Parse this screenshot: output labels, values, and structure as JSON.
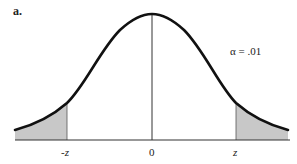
{
  "panel_label": "a.",
  "annotation": "α = .01",
  "x_axis": {
    "ticks": [
      {
        "label": "-z",
        "x": 67
      },
      {
        "label": "0",
        "x": 152
      },
      {
        "label": "z",
        "x": 236
      }
    ]
  },
  "figure": {
    "type": "normal-distribution-curve",
    "two_tailed": true,
    "alpha": 0.01,
    "shaded_regions": [
      "left-tail",
      "right-tail"
    ],
    "colors": {
      "curve": "#111111",
      "shade": "#c8c8c8",
      "axis": "#333333"
    }
  }
}
